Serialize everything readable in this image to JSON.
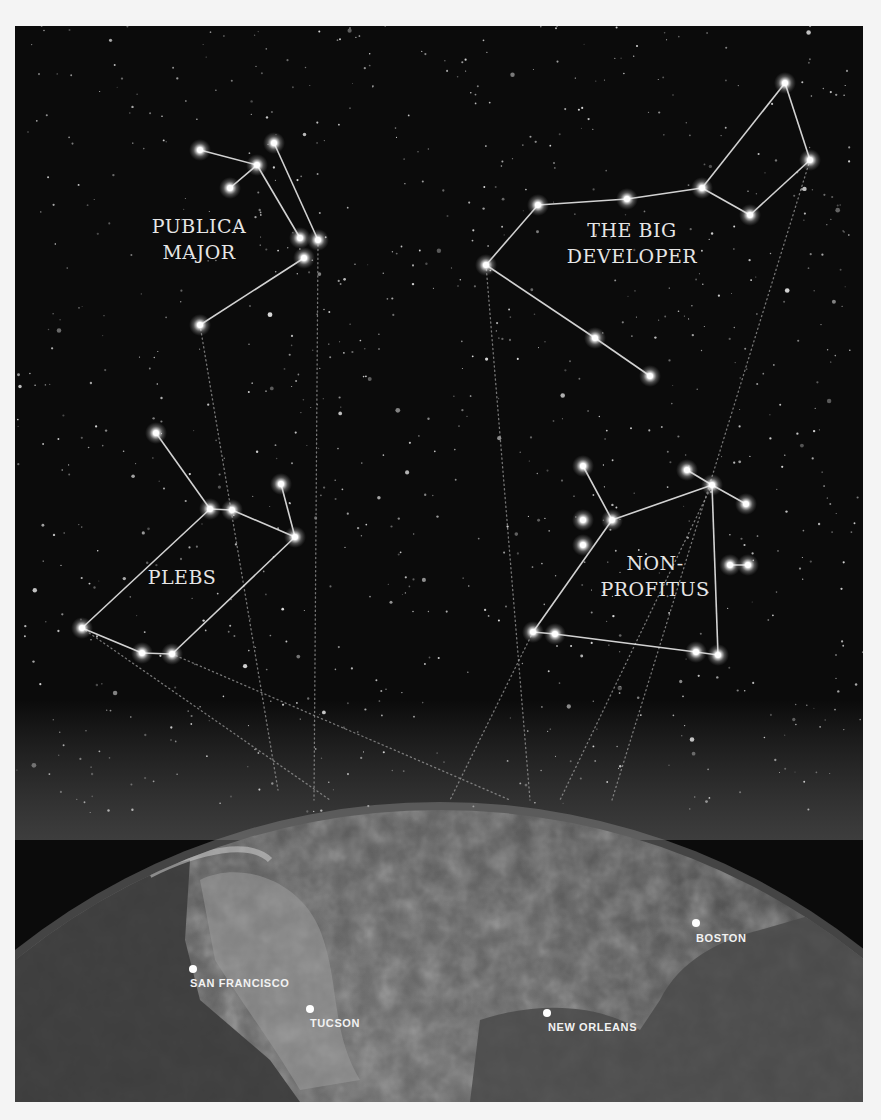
{
  "frame": {
    "x": 15,
    "y": 26,
    "width": 848,
    "height": 1076,
    "background": "#0b0b0b"
  },
  "constellations": [
    {
      "name": "Publica Major",
      "label_lines": [
        "PUBLICA",
        "MAJOR"
      ],
      "label_pos": [
        199,
        233
      ],
      "stars": [
        [
          200,
          150
        ],
        [
          257,
          165
        ],
        [
          274,
          143
        ],
        [
          230,
          188
        ],
        [
          300,
          238
        ],
        [
          318,
          240
        ],
        [
          304,
          258
        ],
        [
          200,
          325
        ]
      ],
      "edges": [
        [
          0,
          1
        ],
        [
          1,
          3
        ],
        [
          1,
          4
        ],
        [
          2,
          5
        ],
        [
          6,
          7
        ]
      ],
      "beams": [
        [
          200,
          325,
          278,
          790
        ],
        [
          318,
          245,
          314,
          800
        ]
      ]
    },
    {
      "name": "The Big Developer",
      "label_lines": [
        "THE BIG",
        "DEVELOPER"
      ],
      "label_pos": [
        632,
        237
      ],
      "stars": [
        [
          486,
          265
        ],
        [
          538,
          205
        ],
        [
          627,
          199
        ],
        [
          702,
          188
        ],
        [
          750,
          215
        ],
        [
          810,
          160
        ],
        [
          785,
          83
        ],
        [
          595,
          338
        ],
        [
          650,
          376
        ]
      ],
      "edges": [
        [
          0,
          1
        ],
        [
          1,
          2
        ],
        [
          2,
          3
        ],
        [
          3,
          4
        ],
        [
          4,
          5
        ],
        [
          5,
          6
        ],
        [
          6,
          3
        ],
        [
          0,
          7
        ],
        [
          7,
          8
        ]
      ],
      "beams": [
        [
          486,
          265,
          530,
          800
        ],
        [
          810,
          160,
          612,
          800
        ]
      ]
    },
    {
      "name": "Plebs",
      "label_lines": [
        "PLEBS"
      ],
      "label_pos": [
        182,
        584
      ],
      "stars": [
        [
          156,
          433
        ],
        [
          210,
          509
        ],
        [
          232,
          510
        ],
        [
          281,
          484
        ],
        [
          295,
          537
        ],
        [
          82,
          628
        ],
        [
          142,
          653
        ],
        [
          172,
          654
        ]
      ],
      "edges": [
        [
          0,
          1
        ],
        [
          1,
          2
        ],
        [
          2,
          4
        ],
        [
          3,
          4
        ],
        [
          1,
          5
        ],
        [
          5,
          6
        ],
        [
          6,
          7
        ],
        [
          7,
          4
        ]
      ],
      "beams": [
        [
          172,
          654,
          510,
          800
        ],
        [
          82,
          628,
          330,
          800
        ]
      ]
    },
    {
      "name": "Non-Profitus",
      "label_lines": [
        "NON-",
        "PROFITUS"
      ],
      "label_pos": [
        655,
        570
      ],
      "stars": [
        [
          583,
          466
        ],
        [
          612,
          520
        ],
        [
          583,
          520
        ],
        [
          583,
          545
        ],
        [
          712,
          485
        ],
        [
          687,
          470
        ],
        [
          746,
          504
        ],
        [
          730,
          565
        ],
        [
          748,
          565
        ],
        [
          533,
          632
        ],
        [
          555,
          634
        ],
        [
          696,
          652
        ],
        [
          718,
          655
        ]
      ],
      "edges": [
        [
          0,
          1
        ],
        [
          1,
          4
        ],
        [
          4,
          5
        ],
        [
          4,
          6
        ],
        [
          1,
          9
        ],
        [
          9,
          10
        ],
        [
          10,
          11
        ],
        [
          11,
          12
        ],
        [
          12,
          4
        ],
        [
          7,
          8
        ]
      ],
      "beams": [
        [
          533,
          632,
          450,
          800
        ],
        [
          712,
          485,
          560,
          800
        ]
      ]
    }
  ],
  "earth": {
    "horizon_center": [
      440,
      1450
    ],
    "radius_x": 660,
    "radius_y": 640
  },
  "cities": [
    {
      "name": "SAN FRANCISCO",
      "dot": [
        193,
        969
      ],
      "label": [
        190,
        987
      ]
    },
    {
      "name": "TUCSON",
      "dot": [
        310,
        1009
      ],
      "label": [
        310,
        1027
      ]
    },
    {
      "name": "NEW ORLEANS",
      "dot": [
        547,
        1013
      ],
      "label": [
        548,
        1031
      ]
    },
    {
      "name": "BOSTON",
      "dot": [
        696,
        923
      ],
      "label": [
        696,
        942
      ]
    }
  ]
}
